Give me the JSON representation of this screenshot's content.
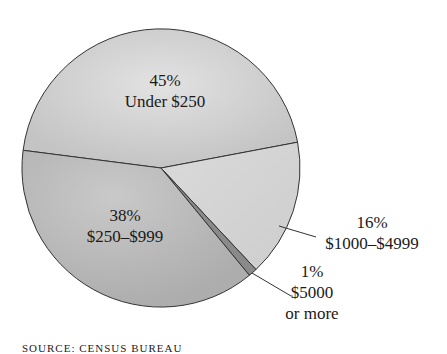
{
  "chart_data": {
    "type": "pie",
    "title": "",
    "categories": [
      "Under $250",
      "$1000–$4999",
      "$5000 or more",
      "$250–$999"
    ],
    "values": [
      45,
      16,
      1,
      38
    ],
    "unit": "%",
    "labels": [
      {
        "pct": "45%",
        "text": "Under $250"
      },
      {
        "pct": "16%",
        "text": "$1000–$4999"
      },
      {
        "pct": "1%",
        "text_line1": "$5000",
        "text_line2": "or more"
      },
      {
        "pct": "38%",
        "text": "$250–$999"
      }
    ],
    "colors": [
      "#cfcfcf",
      "#d6d6d6",
      "#8a8a8a",
      "#bdbdbd"
    ],
    "legend": "none (labels on/near slices)",
    "source_note": "SOURCE: CENSUS BUREAU"
  }
}
